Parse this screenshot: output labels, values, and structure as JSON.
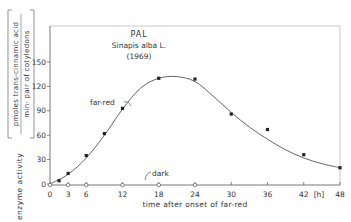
{
  "chart_data": {
    "type": "line",
    "title": "PAL",
    "subtitle": "Sinapis alba L.",
    "year": "(1969)",
    "xlabel": "time after onset of far-red",
    "x_unit": "[h]",
    "ylabel_main": "enzyme activity",
    "ylabel_unit_numerator": "pmoles trans-cinnamic acid",
    "ylabel_unit_denominator": "min· pair of cotyledons",
    "x_ticks": [
      0,
      3,
      6,
      12,
      18,
      24,
      30,
      36,
      42,
      48
    ],
    "y_ticks": [
      0,
      30,
      60,
      90,
      120,
      150
    ],
    "xlim": [
      0,
      48
    ],
    "ylim": [
      0,
      180
    ],
    "grid": false,
    "series": [
      {
        "name": "far-red",
        "marker": "filled-square",
        "x": [
          1.5,
          3,
          6,
          9,
          12,
          18,
          24,
          30,
          36,
          42,
          48
        ],
        "y": [
          4,
          13,
          35,
          62,
          93,
          130,
          129,
          86,
          67,
          36,
          20
        ]
      },
      {
        "name": "dark",
        "marker": "open-circle",
        "x": [
          0,
          3,
          6,
          12,
          18,
          24
        ],
        "y": [
          0,
          0,
          0,
          0,
          0,
          0
        ]
      }
    ],
    "fit_curve": {
      "x": [
        0,
        3,
        6,
        9,
        12,
        15,
        18,
        21,
        24,
        27,
        30,
        33,
        36,
        39,
        42,
        45,
        48
      ],
      "y": [
        0,
        12,
        32,
        60,
        92,
        118,
        130,
        132,
        126,
        108,
        88,
        70,
        55,
        42,
        32,
        25,
        20
      ]
    },
    "annotations": [
      {
        "text": "far-red",
        "x": 9.5,
        "y": 102
      },
      {
        "text": "dark",
        "x": 16,
        "y": 10
      }
    ]
  }
}
